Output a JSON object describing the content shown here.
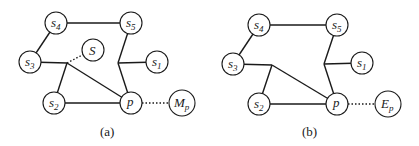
{
  "diagrams": [
    {
      "id": "a",
      "caption": "(a)",
      "nodes": {
        "s4": {
          "base": "s",
          "sub": "4"
        },
        "s5": {
          "base": "s",
          "sub": "5"
        },
        "s3": {
          "base": "s",
          "sub": "3"
        },
        "S": {
          "base": "S",
          "sub": ""
        },
        "s1": {
          "base": "s",
          "sub": "1"
        },
        "s2": {
          "base": "s",
          "sub": "2"
        },
        "p": {
          "base": "p",
          "sub": ""
        },
        "M": {
          "base": "M",
          "sub": "p"
        }
      }
    },
    {
      "id": "b",
      "caption": "(b)",
      "nodes": {
        "s4": {
          "base": "s",
          "sub": "4"
        },
        "s5": {
          "base": "s",
          "sub": "5"
        },
        "s3": {
          "base": "s",
          "sub": "3"
        },
        "s1": {
          "base": "s",
          "sub": "1"
        },
        "s2": {
          "base": "s",
          "sub": "2"
        },
        "p": {
          "base": "p",
          "sub": ""
        },
        "E": {
          "base": "E",
          "sub": "p"
        }
      }
    }
  ]
}
